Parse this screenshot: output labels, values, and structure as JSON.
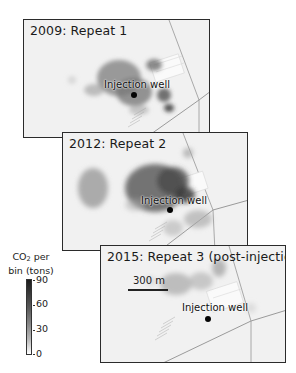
{
  "figure": {
    "type": "time-lapse seismic CO2 plume maps",
    "panels": [
      {
        "title": "2009: Repeat 1",
        "well_label": "Injection well",
        "well_marker": "black-dot"
      },
      {
        "title": "2012: Repeat 2",
        "well_label": "Injection well",
        "well_marker": "black-dot"
      },
      {
        "title": "2015: Repeat 3 (post-injection)",
        "well_label": "Injection well",
        "well_marker": "black-dot",
        "scale_bar": "300 m"
      }
    ],
    "colorbar": {
      "title_line1": "CO",
      "title_sub": "2",
      "title_line1_suffix": " per",
      "title_line2": "bin (tons)",
      "ticks": [
        "90",
        "60",
        "30",
        "0"
      ],
      "min": 0,
      "max": 90,
      "colormap": "greyscale (white=0, black=90)"
    }
  },
  "colors": {
    "map_background": "#f1f1f1",
    "panel_border": "#2b2b2b",
    "road": "#9a9a9a",
    "plume_dark": "#3c3c3c",
    "plume_light": "#c4c4c4"
  }
}
